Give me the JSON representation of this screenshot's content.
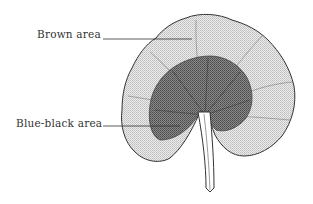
{
  "diagram": {
    "labels": [
      {
        "id": "brown",
        "text": "Brown area"
      },
      {
        "id": "blue-black",
        "text": "Blue-black area"
      }
    ],
    "colors": {
      "outline": "#333333",
      "light_region": "#d9d9d9",
      "dark_region": "#6e6e6e",
      "stem": "#ffffff"
    }
  }
}
